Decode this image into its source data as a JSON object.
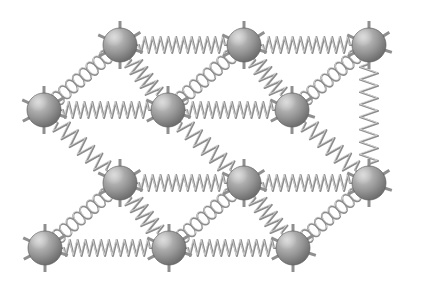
{
  "figure": {
    "background_color": "#ffffff",
    "canvas": {
      "width": 422,
      "height": 289
    }
  },
  "style": {
    "atom_radius": 17,
    "atom_fill_light": "#bdbdbd",
    "atom_fill_mid": "#949494",
    "atom_fill_dark": "#6b6b6b",
    "atom_outline": "#5f5f5f",
    "spring_color": "#8c8c8c",
    "spring_highlight": "#d8d8d8",
    "stub_color": "#8f8f8f"
  },
  "lattice": {
    "rows": 4,
    "columns": 3,
    "depth_layers": 2,
    "atom_count": 12,
    "bond_count": 20,
    "atoms": [
      {
        "id": "atom-b1",
        "label": "atom",
        "layer": "back",
        "row": 1,
        "col": 1,
        "cx": 120,
        "cy": 45,
        "r": 17
      },
      {
        "id": "atom-b2",
        "label": "atom",
        "layer": "back",
        "row": 1,
        "col": 2,
        "cx": 244,
        "cy": 45,
        "r": 17
      },
      {
        "id": "atom-b3",
        "label": "atom",
        "layer": "back",
        "row": 1,
        "col": 3,
        "cx": 369,
        "cy": 45,
        "r": 17
      },
      {
        "id": "atom-f1",
        "label": "atom",
        "layer": "front",
        "row": 2,
        "col": 1,
        "cx": 44,
        "cy": 110,
        "r": 17
      },
      {
        "id": "atom-f2",
        "label": "atom",
        "layer": "front",
        "row": 2,
        "col": 2,
        "cx": 168,
        "cy": 110,
        "r": 17
      },
      {
        "id": "atom-f3",
        "label": "atom",
        "layer": "front",
        "row": 2,
        "col": 3,
        "cx": 292,
        "cy": 110,
        "r": 17
      },
      {
        "id": "atom-b4",
        "label": "atom",
        "layer": "back",
        "row": 3,
        "col": 1,
        "cx": 120,
        "cy": 183,
        "r": 17
      },
      {
        "id": "atom-b5",
        "label": "atom",
        "layer": "back",
        "row": 3,
        "col": 2,
        "cx": 244,
        "cy": 183,
        "r": 17
      },
      {
        "id": "atom-b6",
        "label": "atom",
        "layer": "back",
        "row": 3,
        "col": 3,
        "cx": 369,
        "cy": 183,
        "r": 17
      },
      {
        "id": "atom-f4",
        "label": "atom",
        "layer": "front",
        "row": 4,
        "col": 1,
        "cx": 45,
        "cy": 248,
        "r": 17
      },
      {
        "id": "atom-f5",
        "label": "atom",
        "layer": "front",
        "row": 4,
        "col": 2,
        "cx": 169,
        "cy": 248,
        "r": 17
      },
      {
        "id": "atom-f6",
        "label": "atom",
        "layer": "front",
        "row": 4,
        "col": 3,
        "cx": 293,
        "cy": 248,
        "r": 17
      }
    ],
    "bonds": [
      {
        "id": "bond-b1-b2",
        "type": "zigzag",
        "from": "atom-b1",
        "to": "atom-b2",
        "orientation": "horizontal"
      },
      {
        "id": "bond-b2-b3",
        "type": "zigzag",
        "from": "atom-b2",
        "to": "atom-b3",
        "orientation": "horizontal"
      },
      {
        "id": "bond-f1-f2",
        "type": "zigzag",
        "from": "atom-f1",
        "to": "atom-f2",
        "orientation": "horizontal"
      },
      {
        "id": "bond-f2-f3",
        "type": "zigzag",
        "from": "atom-f2",
        "to": "atom-f3",
        "orientation": "horizontal"
      },
      {
        "id": "bond-b4-b5",
        "type": "zigzag",
        "from": "atom-b4",
        "to": "atom-b5",
        "orientation": "horizontal"
      },
      {
        "id": "bond-b5-b6",
        "type": "zigzag",
        "from": "atom-b5",
        "to": "atom-b6",
        "orientation": "horizontal"
      },
      {
        "id": "bond-f4-f5",
        "type": "zigzag",
        "from": "atom-f4",
        "to": "atom-f5",
        "orientation": "horizontal"
      },
      {
        "id": "bond-f5-f6",
        "type": "zigzag",
        "from": "atom-f5",
        "to": "atom-f6",
        "orientation": "horizontal"
      },
      {
        "id": "bond-b1-f2",
        "type": "zigzag",
        "from": "atom-b1",
        "to": "atom-f2",
        "orientation": "vertical"
      },
      {
        "id": "bond-b2-f3",
        "type": "zigzag",
        "from": "atom-b2",
        "to": "atom-f3",
        "orientation": "vertical"
      },
      {
        "id": "bond-b3-r",
        "type": "zigzag",
        "from": "atom-b3",
        "to": "atom-b6",
        "orientation": "vertical"
      },
      {
        "id": "bond-f1-b4",
        "type": "zigzag",
        "from": "atom-f1",
        "to": "atom-b4",
        "orientation": "vertical"
      },
      {
        "id": "bond-f2-b5",
        "type": "zigzag",
        "from": "atom-f2",
        "to": "atom-b5",
        "orientation": "vertical"
      },
      {
        "id": "bond-f3-b6",
        "type": "zigzag",
        "from": "atom-f3",
        "to": "atom-b6",
        "orientation": "vertical"
      },
      {
        "id": "bond-b4-f5",
        "type": "zigzag",
        "from": "atom-b4",
        "to": "atom-f5",
        "orientation": "vertical"
      },
      {
        "id": "bond-b5-f6",
        "type": "zigzag",
        "from": "atom-b5",
        "to": "atom-f6",
        "orientation": "vertical"
      },
      {
        "id": "coil-f1-b1",
        "type": "helix",
        "from": "atom-f1",
        "to": "atom-b1",
        "orientation": "depth"
      },
      {
        "id": "coil-f2-b2",
        "type": "helix",
        "from": "atom-f2",
        "to": "atom-b2",
        "orientation": "depth"
      },
      {
        "id": "coil-f3-b3",
        "type": "helix",
        "from": "atom-f3",
        "to": "atom-b3",
        "orientation": "depth"
      },
      {
        "id": "coil-f4-b4",
        "type": "helix",
        "from": "atom-f4",
        "to": "atom-b4",
        "orientation": "depth"
      },
      {
        "id": "coil-f5-b5",
        "type": "helix",
        "from": "atom-f5",
        "to": "atom-b5",
        "orientation": "depth"
      },
      {
        "id": "coil-f6-b6",
        "type": "helix",
        "from": "atom-f6",
        "to": "atom-b6",
        "orientation": "depth"
      }
    ]
  }
}
